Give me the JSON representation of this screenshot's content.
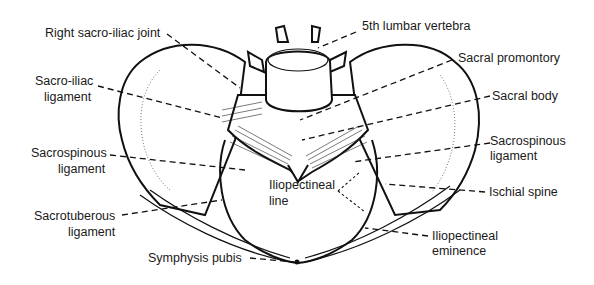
{
  "figure": {
    "labels": {
      "right_sacro_iliac_joint": "Right sacro-iliac joint",
      "sacro_iliac_ligament": [
        "Sacro-iliac",
        "ligament"
      ],
      "sacrospinous_ligament_left": [
        "Sacrospinous",
        "ligament"
      ],
      "sacrotuberous_ligament": [
        "Sacrotuberous",
        "ligament"
      ],
      "symphysis_pubis": "Symphysis pubis",
      "fifth_lumbar_vertebra": "5th lumbar vertebra",
      "sacral_promontory": "Sacral promontory",
      "sacral_body": "Sacral body",
      "sacrospinous_ligament_right": [
        "Sacrospinous",
        "ligament"
      ],
      "ischial_spine": "Ischial spine",
      "iliopectineal_line": [
        "Iliopectineal",
        "line"
      ],
      "iliopectineal_eminence": [
        "Iliopectineal",
        "eminence"
      ]
    }
  }
}
